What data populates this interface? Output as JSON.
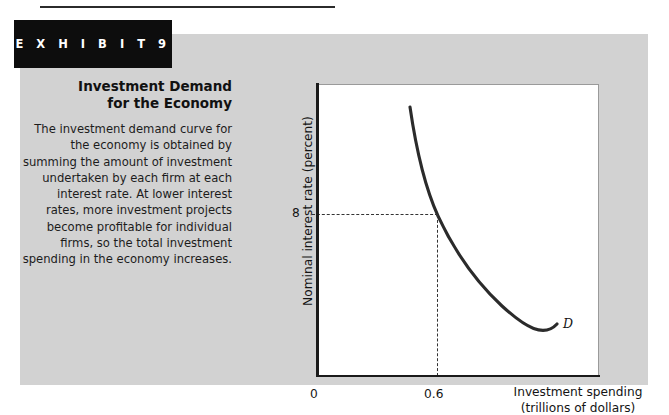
{
  "exhibit": {
    "badge_label": "E X H I B I T   9",
    "title": "Investment Demand\nfor the Economy",
    "caption": "The investment demand curve for the economy is obtained by summing the amount of investment undertaken by each firm at each interest rate. At lower interest rates, more investment projects become profitable for individual firms, so the total investment spending in the economy increases."
  },
  "chart_data": {
    "type": "line",
    "xlabel": "Investment spending\n(trillions of dollars)",
    "ylabel": "Nominal interest rate (percent)",
    "x_ticks": [
      "0",
      "0.6"
    ],
    "y_ticks": [
      "8"
    ],
    "grid": false,
    "legend": false,
    "series": [
      {
        "name": "D",
        "label": "D",
        "label_style": "italic",
        "color": "#2b2b2b",
        "x": [
          0.4,
          0.46,
          0.52,
          0.6,
          0.7,
          0.82,
          0.96,
          1.12,
          1.3,
          1.5,
          1.7
        ],
        "y": [
          13.2,
          11.5,
          10.1,
          8.0,
          6.9,
          6.0,
          5.2,
          4.6,
          4.1,
          3.8,
          3.6
        ]
      }
    ],
    "annotations": [
      {
        "type": "dashed-guide",
        "x": 0.6,
        "y": 8,
        "x_label": "0.6",
        "y_label": "8",
        "description": "Dashed lines mark interest rate 8 percent at investment spending of 0.6 trillion dollars."
      }
    ],
    "xlim": [
      0,
      2.0
    ],
    "ylim": [
      0,
      15
    ]
  },
  "colors": {
    "panel_background": "#d2d2d2",
    "plot_background": "#ffffff",
    "badge_background": "#0d0d0d",
    "curve": "#2b2b2b",
    "axis": "#1a1a1a"
  }
}
